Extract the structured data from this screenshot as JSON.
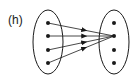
{
  "diagram": {
    "label": "(h)",
    "type": "set-mapping",
    "colors": {
      "stroke": "#1a1a1a",
      "background": "#ffffff"
    },
    "domain": {
      "name": "left-set",
      "element_count": 4,
      "ellipse": {
        "cx": 48,
        "cy": 42,
        "rx": 15,
        "ry": 32
      },
      "points": [
        {
          "x": 48,
          "y": 23
        },
        {
          "x": 48,
          "y": 36
        },
        {
          "x": 48,
          "y": 50
        },
        {
          "x": 48,
          "y": 63
        }
      ]
    },
    "codomain": {
      "name": "right-set",
      "element_count": 4,
      "ellipse": {
        "cx": 114,
        "cy": 42,
        "rx": 15,
        "ry": 32
      },
      "points": [
        {
          "x": 114,
          "y": 23
        },
        {
          "x": 114,
          "y": 36
        },
        {
          "x": 114,
          "y": 50
        },
        {
          "x": 114,
          "y": 63
        }
      ]
    },
    "mappings": [
      {
        "from": 0,
        "to": 1
      },
      {
        "from": 1,
        "to": 1
      },
      {
        "from": 2,
        "to": 1
      },
      {
        "from": 3,
        "to": 1
      }
    ]
  }
}
